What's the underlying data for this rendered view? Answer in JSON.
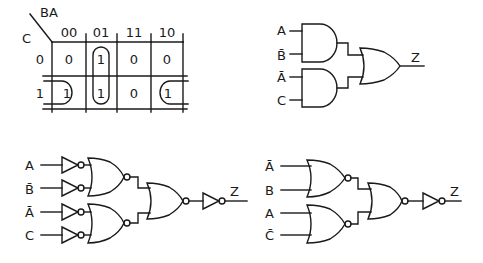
{
  "kmap": {
    "row_var": "C",
    "col_vars": "BA",
    "col_headers": [
      "00",
      "01",
      "11",
      "10"
    ],
    "row_headers": [
      "0",
      "1"
    ],
    "rows": [
      [
        "0",
        "1",
        "0",
        "0"
      ],
      [
        "1",
        "1",
        "0",
        "1"
      ]
    ],
    "groups": [
      "column-01-pair",
      "row1-wraparound-00-10"
    ]
  },
  "and_or_circuit": {
    "inputs": [
      "A",
      "B̄",
      "Ā",
      "C"
    ],
    "output": "Z",
    "gates": [
      "AND",
      "AND",
      "OR"
    ]
  },
  "nor_inverter_circuit": {
    "inputs": [
      "A",
      "B̄",
      "Ā",
      "C"
    ],
    "output": "Z",
    "gates": [
      "NOT",
      "NOT",
      "NOT",
      "NOT",
      "NOR",
      "NOR",
      "NOR",
      "NOT"
    ]
  },
  "nor_circuit": {
    "inputs": [
      "Ā",
      "B",
      "A",
      "C̄"
    ],
    "output": "Z",
    "gates": [
      "NOR",
      "NOR",
      "NOR",
      "NOT"
    ]
  }
}
